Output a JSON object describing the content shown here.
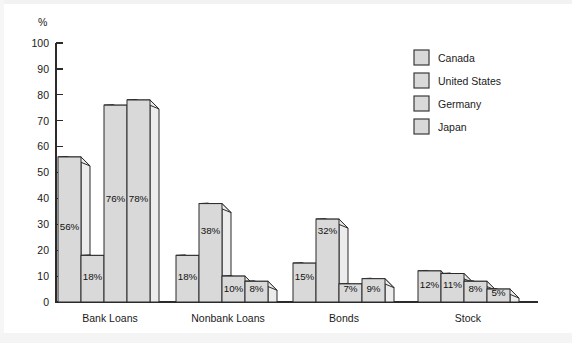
{
  "figure": {
    "unit_label": "%",
    "background_color": "#ffffff",
    "bar_fill_color": "#d9d9d9",
    "bar_side_color": "#ececec",
    "bar_outline_color": "#2b2b2b",
    "axis_color": "#2b2b2b",
    "text_color": "#1a1a1a"
  },
  "chart_data": {
    "type": "bar",
    "title": "",
    "xlabel": "",
    "ylabel": "%",
    "ylim": [
      0,
      100
    ],
    "yticks": [
      0,
      10,
      20,
      30,
      40,
      50,
      60,
      70,
      80,
      90,
      100
    ],
    "grid": false,
    "legend_position": "top-right",
    "categories": [
      "Bank Loans",
      "Nonbank Loans",
      "Bonds",
      "Stock"
    ],
    "series": [
      {
        "name": "Canada",
        "values": [
          56,
          18,
          15,
          12
        ],
        "labels": [
          "56%",
          "18%",
          "15%",
          "12%"
        ]
      },
      {
        "name": "United States",
        "values": [
          18,
          38,
          32,
          11
        ],
        "labels": [
          "18%",
          "38%",
          "32%",
          "11%"
        ]
      },
      {
        "name": "Germany",
        "values": [
          76,
          10,
          7,
          8
        ],
        "labels": [
          "76%",
          "10%",
          "7%",
          "8%"
        ]
      },
      {
        "name": "Japan",
        "values": [
          78,
          8,
          9,
          5
        ],
        "labels": [
          "78%",
          "8%",
          "9%",
          "5%"
        ]
      }
    ]
  },
  "legend": {
    "items": [
      {
        "label": "Canada"
      },
      {
        "label": "United States"
      },
      {
        "label": "Germany"
      },
      {
        "label": "Japan"
      }
    ]
  }
}
